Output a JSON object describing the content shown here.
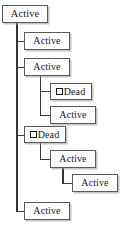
{
  "diagram": {
    "type": "tree",
    "title": "",
    "background_color": "#ffffff",
    "line_color": "#3b3b3b",
    "box_fill_color": "#fdfdfd",
    "box_border_color": "#5a5a5a",
    "labels": {
      "active": "Active",
      "dead": "Dead"
    },
    "icons": {
      "dead_marker": "square-glyph-icon"
    },
    "nodes": [
      {
        "id": "n0",
        "label": "Active",
        "state": "active",
        "level": 0,
        "x": 2,
        "y": 5,
        "w": 46,
        "h": 18
      },
      {
        "id": "n1",
        "label": "Active",
        "state": "active",
        "level": 1,
        "x": 24,
        "y": 32,
        "w": 46,
        "h": 18
      },
      {
        "id": "n2",
        "label": "Active",
        "state": "active",
        "level": 1,
        "x": 24,
        "y": 58,
        "w": 46,
        "h": 18
      },
      {
        "id": "n3",
        "label": "Dead",
        "state": "dead",
        "level": 2,
        "x": 50,
        "y": 83,
        "w": 42,
        "h": 17
      },
      {
        "id": "n4",
        "label": "Active",
        "state": "active",
        "level": 2,
        "x": 50,
        "y": 106,
        "w": 46,
        "h": 18
      },
      {
        "id": "n5",
        "label": "Dead",
        "state": "dead",
        "level": 1,
        "x": 24,
        "y": 126,
        "w": 42,
        "h": 17
      },
      {
        "id": "n6",
        "label": "Active",
        "state": "active",
        "level": 2,
        "x": 50,
        "y": 150,
        "w": 46,
        "h": 18
      },
      {
        "id": "n7",
        "label": "Active",
        "state": "active",
        "level": 3,
        "x": 72,
        "y": 174,
        "w": 46,
        "h": 18
      },
      {
        "id": "n8",
        "label": "Active",
        "state": "active",
        "level": 1,
        "x": 24,
        "y": 202,
        "w": 46,
        "h": 18
      }
    ],
    "edges": [
      {
        "from": "n0",
        "to": "n1"
      },
      {
        "from": "n0",
        "to": "n2"
      },
      {
        "from": "n2",
        "to": "n3"
      },
      {
        "from": "n2",
        "to": "n4"
      },
      {
        "from": "n0",
        "to": "n5"
      },
      {
        "from": "n5",
        "to": "n6"
      },
      {
        "from": "n6",
        "to": "n7"
      },
      {
        "from": "n0",
        "to": "n8"
      }
    ]
  }
}
